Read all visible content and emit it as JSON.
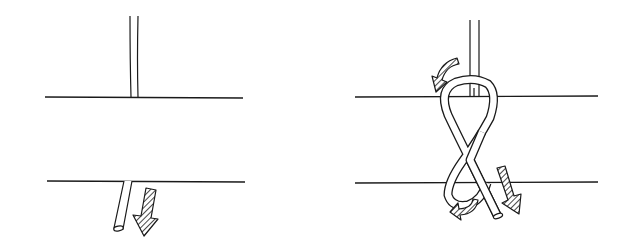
{
  "figure": {
    "type": "knot-tying-illustration",
    "panels": [
      {
        "id": "left",
        "description": "Rope passed down through a hole in a plate (two horizontal lines = plate surfaces), free end pulled downward",
        "plate_lines": [
          {
            "x1": 45,
            "x2": 243,
            "y": 97
          },
          {
            "x1": 47,
            "x2": 245,
            "y": 181
          }
        ],
        "arrows": [
          {
            "semantic": "pull-down-arrow",
            "style": "hatched"
          }
        ]
      },
      {
        "id": "right",
        "description": "Free end forms a figure-eight loop around the standing rope above and below the plate",
        "plate_lines": [
          {
            "x1": 355,
            "x2": 598,
            "y": 97
          },
          {
            "x1": 355,
            "x2": 598,
            "y": 183
          }
        ],
        "arrows": [
          {
            "semantic": "curved-arrow-top-left",
            "style": "hatched"
          },
          {
            "semantic": "curved-arrow-bottom-left",
            "style": "hatched"
          },
          {
            "semantic": "pull-down-arrow-right",
            "style": "hatched"
          }
        ]
      }
    ],
    "colors": {
      "ink": "#1a1a1a",
      "background": "#ffffff"
    }
  }
}
